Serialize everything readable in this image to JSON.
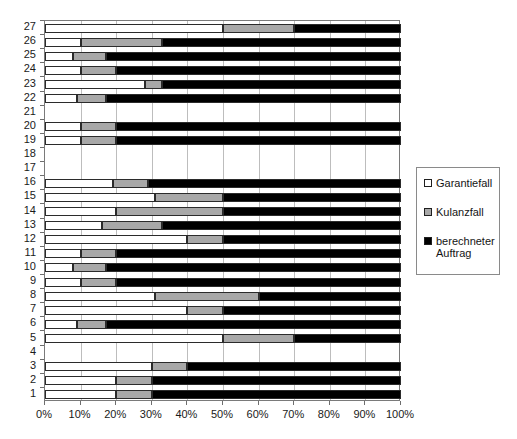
{
  "chart_data": {
    "type": "bar",
    "orientation": "horizontal",
    "stacked": true,
    "normalized": true,
    "title": "",
    "xlabel": "",
    "ylabel": "",
    "xlim": [
      0,
      100
    ],
    "ylim": [
      1,
      27
    ],
    "grid": true,
    "legend_position": "right",
    "categories": [
      "1",
      "2",
      "3",
      "4",
      "5",
      "6",
      "7",
      "8",
      "9",
      "10",
      "11",
      "12",
      "13",
      "14",
      "15",
      "16",
      "17",
      "18",
      "19",
      "20",
      "21",
      "22",
      "23",
      "24",
      "25",
      "26",
      "27"
    ],
    "xticks": [
      0,
      10,
      20,
      30,
      40,
      50,
      60,
      70,
      80,
      90,
      100
    ],
    "xtick_labels": [
      "0%",
      "10%",
      "20%",
      "30%",
      "40%",
      "50%",
      "60%",
      "70%",
      "80%",
      "90%",
      "100%"
    ],
    "series": [
      {
        "name": "Garantiefall",
        "color": "#ffffff",
        "values": [
          20,
          20,
          30,
          0,
          50,
          9,
          40,
          31,
          10,
          8,
          10,
          40,
          16,
          20,
          31,
          19,
          0,
          0,
          10,
          10,
          0,
          9,
          28,
          10,
          8,
          10,
          50
        ]
      },
      {
        "name": "Kulanzfall",
        "color": "#a8a8a8",
        "values": [
          10,
          10,
          10,
          0,
          20,
          8,
          10,
          29,
          10,
          9,
          10,
          10,
          17,
          30,
          19,
          10,
          0,
          0,
          10,
          10,
          0,
          8,
          5,
          10,
          9,
          23,
          20
        ]
      },
      {
        "name": "berechneter Auftrag",
        "color": "#000000",
        "values": [
          70,
          70,
          60,
          0,
          30,
          83,
          50,
          40,
          80,
          83,
          80,
          50,
          67,
          50,
          50,
          71,
          0,
          0,
          80,
          80,
          0,
          83,
          67,
          80,
          83,
          67,
          30
        ]
      }
    ],
    "empty_categories": [
      "4",
      "17",
      "18",
      "21"
    ]
  },
  "legend": {
    "items": [
      {
        "label": "Garantiefall",
        "swatch": "garantie"
      },
      {
        "label": "Kulanzfall",
        "swatch": "kulanz"
      },
      {
        "label": "berechneter\nAuftrag",
        "swatch": "berechnet"
      }
    ]
  }
}
